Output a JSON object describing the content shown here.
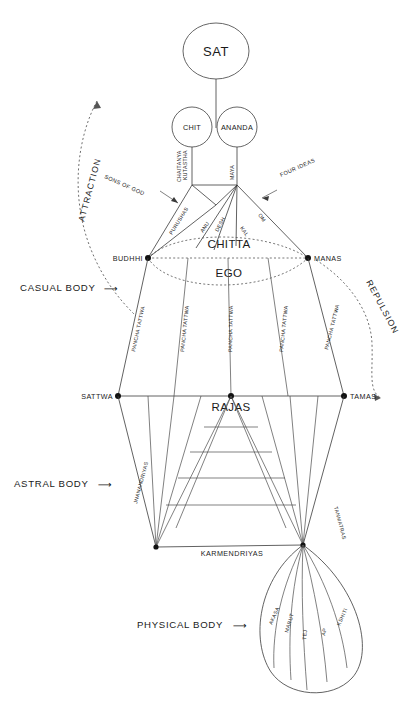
{
  "nodes": {
    "sat": "SAT",
    "chit": "CHIT",
    "ananda": "ANANDA",
    "buddhi": "BUDHHI",
    "manas": "MANAS",
    "chitta": "CHITTA",
    "ego": "EGO",
    "sattwa": "SATTWA",
    "tamas": "TAMAS",
    "rajas": "RAJAS"
  },
  "links": {
    "kutastha": "KUTASTHA",
    "chaitanya": "CHAITANYA",
    "maya": "MAYA",
    "purushas": "PURUSHAS",
    "anu": "ANU",
    "desh": "DESH",
    "kal": "KAL",
    "om": "OM"
  },
  "annotations": {
    "sons_of_god": "SONS OF GOD",
    "four_ideas": "FOUR IDEAS",
    "attraction": "ATTRACTION",
    "repulsion": "REPULSION",
    "arrow_right": "⟶",
    "arrow_left": "⟵"
  },
  "bodies": {
    "casual": "CASUAL BODY",
    "astral": "ASTRAL BODY",
    "physical": "PHYSICAL BODY"
  },
  "casual_body": {
    "band_label": "PANCHA TATTWA",
    "band_count": 5
  },
  "astral_body": {
    "left_label": "JNANANDRIYAS",
    "right_label": "TANMATRAS",
    "bottom_label": "KARMENDRIYAS"
  },
  "physical_body": {
    "elements": [
      "AKASA",
      "MARUT",
      "TEJ",
      "AP",
      "KSHITI"
    ]
  },
  "colors": {
    "background": "#ffffff",
    "line": "#3a3a3a",
    "dotted": "#555555",
    "text": "#1a1a1a",
    "node_fill": "#ffffff"
  }
}
